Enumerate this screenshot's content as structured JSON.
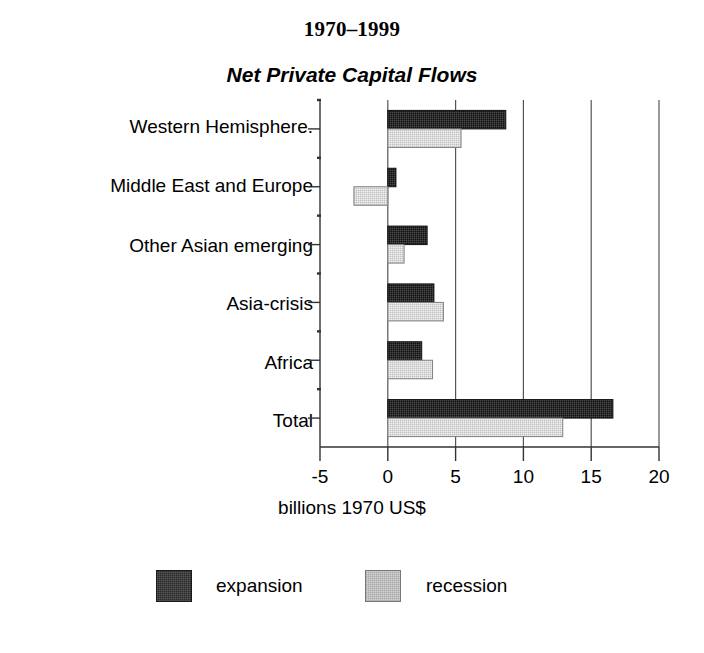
{
  "chart_data": {
    "type": "bar",
    "orientation": "horizontal",
    "title": "1970–1999",
    "subtitle": "Net Private Capital Flows",
    "xlabel": "billions 1970 US$",
    "ylabel": "",
    "xlim": [
      -5,
      20
    ],
    "xticks": [
      -5,
      0,
      5,
      10,
      15,
      20
    ],
    "xtick_labels": [
      "-5",
      "0",
      "5",
      "10",
      "15",
      "20"
    ],
    "grid": "vertical",
    "legend_position": "bottom",
    "categories": [
      "Western Hemisphere.",
      "Middle East and Europe",
      "Other Asian emerging",
      "Asia-crisis",
      "Africa",
      "Total"
    ],
    "series": [
      {
        "name": "expansion",
        "color": "#2b2b2b",
        "values": [
          8.7,
          0.6,
          2.9,
          3.4,
          2.5,
          16.6
        ]
      },
      {
        "name": "recession",
        "color": "#d3d3d3",
        "values": [
          5.4,
          -2.5,
          1.2,
          4.1,
          3.3,
          12.9
        ]
      }
    ]
  },
  "legend": {
    "items": [
      {
        "label": "expansion"
      },
      {
        "label": "recession"
      }
    ]
  },
  "colors": {
    "expansion": "#2b2b2b",
    "recession": "#d3d3d3",
    "axis": "#333333",
    "background": "#ffffff"
  }
}
